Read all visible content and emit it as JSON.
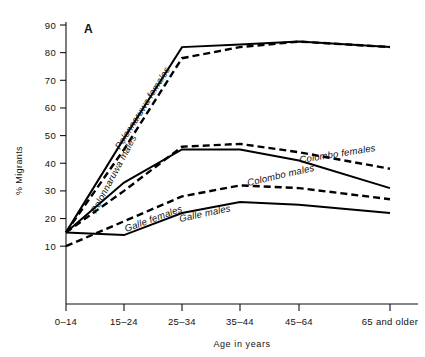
{
  "figure": {
    "panel_letter": "A",
    "ylabel": "% Migrants",
    "xlabel": "Age in years"
  },
  "chart_data": {
    "type": "line",
    "title": "A",
    "xlabel": "Age in years",
    "ylabel": "% Migrants",
    "categories": [
      "0–14",
      "15–24",
      "25–34",
      "35–44",
      "45–64",
      "65 and older"
    ],
    "x_tick_labels": [
      "0–14",
      "15–24",
      "25–34",
      "35–44",
      "45–64",
      "65 and older"
    ],
    "y_tick_labels": [
      "10",
      "20",
      "30",
      "40",
      "50",
      "60",
      "70",
      "80",
      "90"
    ],
    "ylim": [
      5,
      93
    ],
    "yticks": [
      10,
      20,
      30,
      40,
      50,
      60,
      70,
      80,
      90
    ],
    "grid": false,
    "legend": "inline-curve-labels",
    "series": [
      {
        "name": "Polonnaruwa males",
        "style": "solid",
        "values": [
          15,
          49,
          82,
          83,
          84,
          82
        ]
      },
      {
        "name": "Polonnaruwa females",
        "style": "dashed",
        "values": [
          15,
          45,
          78,
          82,
          84,
          82
        ]
      },
      {
        "name": "Colombo males",
        "style": "solid",
        "values": [
          15,
          33,
          45,
          45,
          41,
          31
        ]
      },
      {
        "name": "Colombo females",
        "style": "dashed",
        "values": [
          15,
          30,
          46,
          47,
          44,
          38
        ]
      },
      {
        "name": "Galle females",
        "style": "dashed",
        "values": [
          10,
          19,
          28,
          32,
          31,
          27
        ]
      },
      {
        "name": "Galle males",
        "style": "solid",
        "values": [
          15,
          14,
          22,
          26,
          25,
          22
        ]
      }
    ],
    "annotations": [
      {
        "text": "Polonnaruwa males",
        "rotation": -62,
        "x": 96,
        "y": 214
      },
      {
        "text": "Polonnaruwa females",
        "rotation": -58,
        "x": 120,
        "y": 150
      },
      {
        "text": "Colombo females",
        "rotation": -9,
        "x": 300,
        "y": 163
      },
      {
        "text": "Colombo males",
        "rotation": -13,
        "x": 248,
        "y": 186
      },
      {
        "text": "Galle females",
        "rotation": -20,
        "x": 126,
        "y": 232
      },
      {
        "text": "Galle males",
        "rotation": -12,
        "x": 180,
        "y": 222
      }
    ]
  }
}
